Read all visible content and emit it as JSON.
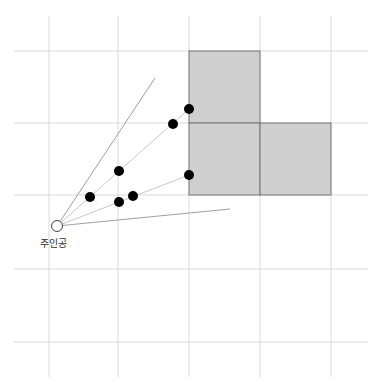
{
  "diagram": {
    "type": "grid-visibility-diagram",
    "grid": {
      "vertical_x": [
        49,
        118,
        189,
        260,
        331
      ],
      "horizontal_y": [
        51,
        123,
        195,
        269,
        342
      ],
      "x_extent": [
        14,
        368
      ],
      "y_extent": [
        16,
        377
      ],
      "line_color": "#d9d9d9"
    },
    "blocks": [
      {
        "x": 189,
        "y": 51,
        "w": 71,
        "h": 72
      },
      {
        "x": 189,
        "y": 123,
        "w": 71,
        "h": 72
      },
      {
        "x": 260,
        "y": 123,
        "w": 71,
        "h": 72
      }
    ],
    "block_fill": "#cfcfcf",
    "block_stroke": "#777777",
    "origin": {
      "x": 57,
      "y": 226,
      "label": "주인공"
    },
    "rays": [
      {
        "to": [
          155,
          78
        ],
        "color": "#a0a0a0"
      },
      {
        "to": [
          189,
          109
        ],
        "color": "#c8c8c8"
      },
      {
        "to": [
          189,
          175
        ],
        "color": "#c8c8c8"
      },
      {
        "to": [
          230,
          209
        ],
        "color": "#a0a0a0"
      }
    ],
    "points": [
      {
        "x": 90,
        "y": 197
      },
      {
        "x": 119,
        "y": 171
      },
      {
        "x": 119,
        "y": 202
      },
      {
        "x": 133,
        "y": 196
      },
      {
        "x": 173,
        "y": 124
      },
      {
        "x": 189,
        "y": 109
      },
      {
        "x": 189,
        "y": 175
      }
    ],
    "point_color": "#000000"
  }
}
